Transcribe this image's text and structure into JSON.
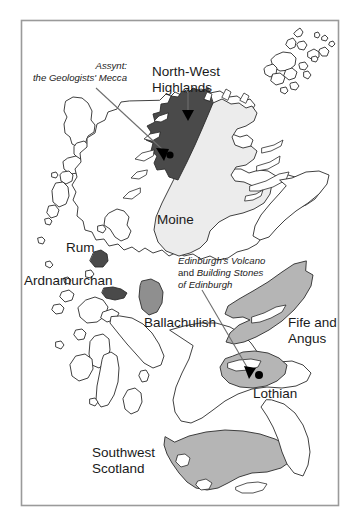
{
  "figure": {
    "name": "geological-regions-of-scotland-map",
    "frame_color": "#9a9a9a",
    "background_color": "#ffffff"
  },
  "palette": {
    "outline": "#2b2b2b",
    "dark_region": "#4a4a4a",
    "mid_region": "#b5b5b5",
    "light_region": "#ececec",
    "marker": "#000000",
    "leader_line": "#6e6e6e",
    "text": "#1a1a1a"
  },
  "labels": {
    "assynt": {
      "line1": "Assynt:",
      "line2": "the Geologists' Mecca",
      "style": "italic",
      "size": "small"
    },
    "north_west_highlands": {
      "line1": "North-West",
      "line2": "Highlands",
      "style": "regular",
      "size": "large"
    },
    "moine": {
      "line1": "Moine",
      "style": "regular",
      "size": "large"
    },
    "rum": {
      "line1": "Rum",
      "style": "regular",
      "size": "large"
    },
    "ardnamurchan": {
      "line1": "Ardnamurchan",
      "style": "regular",
      "size": "large"
    },
    "ballachulish": {
      "line1": "Ballachulish",
      "style": "regular",
      "size": "large"
    },
    "edinburgh": {
      "line1": "Edinburgh's Volcano",
      "line2a": "and ",
      "line2b": "Building Stones",
      "line3": "of Edinburgh",
      "style": "italic",
      "size": "small"
    },
    "fife_and_angus": {
      "line1": "Fife and",
      "line2": "Angus",
      "style": "regular",
      "size": "large"
    },
    "lothian": {
      "line1": "Lothian",
      "style": "regular",
      "size": "large"
    },
    "southwest_scotland": {
      "line1": "Southwest",
      "line2": "Scotland",
      "style": "regular",
      "size": "large"
    }
  },
  "regions": [
    {
      "name": "north-west-highlands",
      "shade": "dark",
      "label": "North-West Highlands"
    },
    {
      "name": "moine",
      "shade": "light",
      "label": "Moine"
    },
    {
      "name": "rum",
      "shade": "dark",
      "label": "Rum"
    },
    {
      "name": "ardnamurchan",
      "shade": "dark",
      "label": "Ardnamurchan"
    },
    {
      "name": "ballachulish",
      "shade": "mid-dark",
      "label": "Ballachulish"
    },
    {
      "name": "fife-and-angus",
      "shade": "mid",
      "label": "Fife and Angus"
    },
    {
      "name": "lothian",
      "shade": "mid",
      "label": "Lothian"
    },
    {
      "name": "southwest-scotland",
      "shade": "mid",
      "label": "Southwest Scotland"
    }
  ],
  "markers": [
    {
      "name": "assynt-arrow",
      "type": "arrow"
    },
    {
      "name": "north-west-highlands-arrow",
      "type": "arrow"
    },
    {
      "name": "assynt-dot",
      "type": "dot"
    },
    {
      "name": "edinburgh-arrow",
      "type": "arrow"
    },
    {
      "name": "edinburgh-dot",
      "type": "dot"
    }
  ]
}
